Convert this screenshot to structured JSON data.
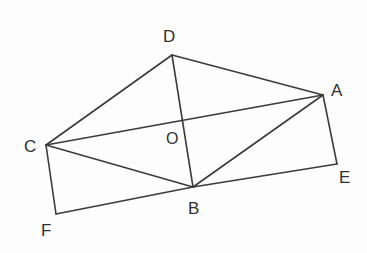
{
  "figure": {
    "background_color": "#fdfdfd",
    "line_color": "#3b3b3b",
    "label_color": "#313131",
    "width": 367,
    "height": 253
  },
  "points": {
    "D": {
      "label": "D",
      "x": 172,
      "y": 55,
      "label_x": 163,
      "label_y": 28
    },
    "A": {
      "label": "A",
      "x": 323,
      "y": 95,
      "label_x": 331,
      "label_y": 82
    },
    "C": {
      "label": "C",
      "x": 46,
      "y": 145,
      "label_x": 24,
      "label_y": 138
    },
    "O": {
      "label": "O",
      "x": 183,
      "y": 122,
      "label_x": 166,
      "label_y": 131
    },
    "B": {
      "label": "B",
      "x": 193,
      "y": 187,
      "label_x": 188,
      "label_y": 200
    },
    "E": {
      "label": "E",
      "x": 337,
      "y": 164,
      "label_x": 339,
      "label_y": 169
    },
    "F": {
      "label": "F",
      "x": 56,
      "y": 214,
      "label_x": 41,
      "label_y": 222
    }
  },
  "edges": [
    {
      "name": "edge-C-D",
      "from": "C",
      "to": "D",
      "d": "M 46 145 L 172 55"
    },
    {
      "name": "edge-D-A",
      "from": "D",
      "to": "A",
      "d": "M 172 55 L 323 95"
    },
    {
      "name": "edge-D-B",
      "from": "D",
      "to": "B",
      "d": "M 172 55 L 193 187"
    },
    {
      "name": "edge-C-A",
      "from": "C",
      "to": "A",
      "d": "M 46 145 L 323 95"
    },
    {
      "name": "edge-C-B",
      "from": "C",
      "to": "B",
      "d": "M 46 145 L 193 187"
    },
    {
      "name": "edge-C-F",
      "from": "C",
      "to": "F",
      "d": "M 46 145 L 56 214"
    },
    {
      "name": "edge-A-B",
      "from": "A",
      "to": "B",
      "d": "M 323 95 L 193 187"
    },
    {
      "name": "edge-A-E",
      "from": "A",
      "to": "E",
      "d": "M 323 95 L 337 164"
    },
    {
      "name": "edge-F-B-E",
      "from": "F",
      "to": "E",
      "d": "M 56 214 L 193 187 L 337 164"
    }
  ]
}
